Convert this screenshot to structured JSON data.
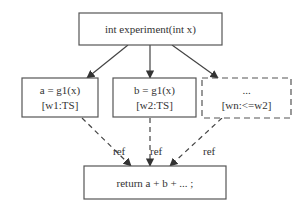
{
  "diagram": {
    "nodes": {
      "root": {
        "label": "int experiment(int x)"
      },
      "a": {
        "line1": "a = g1(x)",
        "line2": "[w1:TS]"
      },
      "b": {
        "line1": "b = g1(x)",
        "line2": "[w2:TS]"
      },
      "n": {
        "line1": "...",
        "line2": "[wn:<=w2]",
        "style": "dashed"
      },
      "ret": {
        "label": "return a + b + ... ;"
      }
    },
    "edges": [
      {
        "from": "root",
        "to": "a",
        "style": "solid"
      },
      {
        "from": "root",
        "to": "b",
        "style": "solid"
      },
      {
        "from": "root",
        "to": "n",
        "style": "solid"
      },
      {
        "from": "a",
        "to": "ret",
        "style": "dashed",
        "label": "ref"
      },
      {
        "from": "b",
        "to": "ret",
        "style": "dashed",
        "label": "ref"
      },
      {
        "from": "n",
        "to": "ret",
        "style": "dashed",
        "label": "ref"
      }
    ],
    "edge_labels": [
      "ref",
      "ref",
      "ref"
    ]
  }
}
